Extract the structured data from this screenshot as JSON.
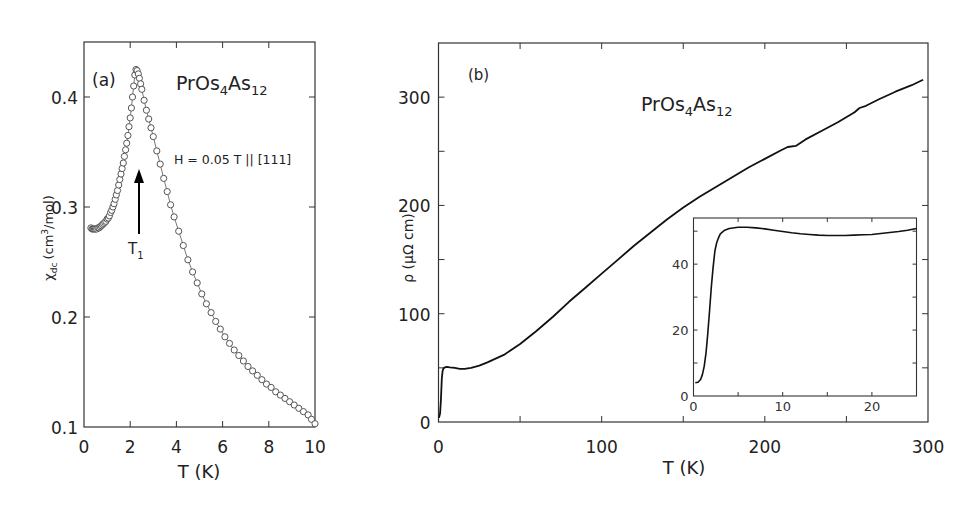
{
  "chart_data": [
    {
      "id": "a",
      "type": "scatter",
      "panel_label": "(a)",
      "title": "PrOs4As12",
      "title_parts": {
        "base1": "PrOs",
        "sub1": "4",
        "base2": "As",
        "sub2": "12"
      },
      "xlabel": "T (K)",
      "ylabel": "χdc (cm3/mol)",
      "ylabel_parts": {
        "chi": "χ",
        "sub": "dc",
        "unit_a": "(cm",
        "sup": "3",
        "unit_b": "/mol)"
      },
      "xlim": [
        0,
        10
      ],
      "ylim": [
        0.1,
        0.45
      ],
      "xticks": [
        0,
        2,
        4,
        6,
        8,
        10
      ],
      "xtick_labels": [
        "0",
        "2",
        "4",
        "6",
        "8",
        "10"
      ],
      "yticks": [
        0.1,
        0.2,
        0.3,
        0.4
      ],
      "ytick_labels": [
        "0.1",
        "0.2",
        "0.3",
        "0.4"
      ],
      "grid": false,
      "marker": "open-circle-connected",
      "annotations": {
        "field": "H = 0.05 T || [111]",
        "arrow_label": "T",
        "arrow_label_sub": "1",
        "arrow_T": 2.25
      },
      "series": [
        {
          "name": "chi_dc",
          "x": [
            0.3,
            0.35,
            0.4,
            0.45,
            0.5,
            0.55,
            0.6,
            0.65,
            0.7,
            0.75,
            0.8,
            0.85,
            0.9,
            0.95,
            1.0,
            1.05,
            1.1,
            1.15,
            1.2,
            1.25,
            1.3,
            1.35,
            1.4,
            1.45,
            1.5,
            1.55,
            1.6,
            1.65,
            1.7,
            1.75,
            1.8,
            1.85,
            1.9,
            1.95,
            2.0,
            2.05,
            2.1,
            2.15,
            2.2,
            2.25,
            2.3,
            2.35,
            2.4,
            2.45,
            2.5,
            2.6,
            2.7,
            2.8,
            2.9,
            3.0,
            3.15,
            3.3,
            3.45,
            3.6,
            3.75,
            3.9,
            4.1,
            4.3,
            4.5,
            4.7,
            4.9,
            5.1,
            5.3,
            5.5,
            5.7,
            5.9,
            6.1,
            6.3,
            6.5,
            6.7,
            6.9,
            7.1,
            7.3,
            7.5,
            7.7,
            7.9,
            8.1,
            8.3,
            8.5,
            8.7,
            8.9,
            9.1,
            9.3,
            9.5,
            9.7,
            9.85,
            10.0
          ],
          "y": [
            0.281,
            0.28,
            0.28,
            0.28,
            0.28,
            0.28,
            0.281,
            0.281,
            0.282,
            0.283,
            0.284,
            0.285,
            0.286,
            0.287,
            0.289,
            0.29,
            0.292,
            0.295,
            0.297,
            0.3,
            0.303,
            0.307,
            0.311,
            0.315,
            0.32,
            0.325,
            0.33,
            0.335,
            0.34,
            0.346,
            0.352,
            0.358,
            0.365,
            0.373,
            0.381,
            0.39,
            0.4,
            0.41,
            0.42,
            0.425,
            0.424,
            0.421,
            0.417,
            0.412,
            0.407,
            0.397,
            0.388,
            0.38,
            0.372,
            0.364,
            0.351,
            0.339,
            0.326,
            0.314,
            0.302,
            0.291,
            0.278,
            0.265,
            0.252,
            0.241,
            0.231,
            0.221,
            0.212,
            0.204,
            0.196,
            0.189,
            0.182,
            0.176,
            0.17,
            0.165,
            0.16,
            0.155,
            0.151,
            0.147,
            0.143,
            0.139,
            0.136,
            0.132,
            0.129,
            0.126,
            0.123,
            0.12,
            0.117,
            0.114,
            0.111,
            0.107,
            0.103
          ]
        }
      ]
    },
    {
      "id": "b",
      "type": "line",
      "panel_label": "(b)",
      "title": "PrOs4As12",
      "title_parts": {
        "base1": "PrOs",
        "sub1": "4",
        "base2": "As",
        "sub2": "12"
      },
      "xlabel": "T (K)",
      "ylabel": "ρ (μΩ cm)",
      "xlim": [
        0,
        300
      ],
      "ylim": [
        0,
        350
      ],
      "xticks": [
        0,
        100,
        200,
        300
      ],
      "xtick_labels": [
        "0",
        "100",
        "200",
        "300"
      ],
      "xminor": [
        50,
        150,
        250
      ],
      "yticks": [
        0,
        100,
        200,
        300
      ],
      "ytick_labels": [
        "0",
        "100",
        "200",
        "300"
      ],
      "yminor": [
        50,
        150,
        250
      ],
      "grid": false,
      "series": [
        {
          "name": "rho",
          "x": [
            0.3,
            1,
            1.5,
            2,
            2.5,
            3,
            4,
            5,
            7,
            10,
            13,
            16,
            20,
            25,
            30,
            40,
            50,
            60,
            70,
            80,
            90,
            100,
            110,
            120,
            130,
            140,
            150,
            160,
            170,
            180,
            190,
            200,
            210,
            214,
            219,
            225,
            235,
            245,
            255,
            258,
            262,
            270,
            280,
            290,
            297
          ],
          "y": [
            4,
            8,
            20,
            40,
            47,
            49.5,
            50.5,
            51,
            50.5,
            50,
            49,
            49,
            50,
            52,
            55,
            62,
            72,
            84,
            97,
            111,
            124,
            137,
            150,
            163,
            175,
            187,
            198,
            208,
            217,
            226,
            235,
            243,
            251,
            254,
            255,
            261,
            269,
            277,
            286,
            290,
            292,
            298,
            305,
            311,
            316
          ]
        }
      ]
    },
    {
      "id": "b-inset",
      "type": "line",
      "xlabel": "",
      "ylabel": "",
      "xlim": [
        0,
        25
      ],
      "ylim": [
        0,
        54
      ],
      "xticks": [
        0,
        10,
        20
      ],
      "xtick_labels": [
        "0",
        "10",
        "20"
      ],
      "xminor": [
        5,
        15
      ],
      "yticks": [
        0,
        20,
        40
      ],
      "ytick_labels": [
        "0",
        "20",
        "40"
      ],
      "yminor": [
        10,
        30,
        50
      ],
      "grid": false,
      "series": [
        {
          "name": "rho_low_T",
          "x": [
            0.2,
            0.5,
            0.8,
            1.0,
            1.2,
            1.4,
            1.6,
            1.8,
            2.0,
            2.2,
            2.4,
            2.6,
            2.8,
            3.0,
            3.5,
            4.0,
            5.0,
            6.0,
            7.0,
            8.0,
            9.0,
            10.0,
            11.0,
            12.0,
            13.0,
            14.0,
            15.0,
            16.0,
            17.0,
            18.0,
            19.0,
            20.0,
            21.0,
            22.0,
            23.0,
            24.0,
            25.0
          ],
          "y": [
            4.0,
            4.2,
            5.0,
            6.5,
            9.0,
            13,
            19,
            26,
            33,
            39,
            44,
            46.5,
            48,
            49.2,
            50.3,
            50.8,
            51.2,
            51.2,
            51.0,
            50.7,
            50.3,
            49.9,
            49.5,
            49.2,
            49.0,
            48.8,
            48.7,
            48.7,
            48.7,
            48.8,
            48.9,
            49.0,
            49.3,
            49.6,
            49.9,
            50.3,
            50.8
          ]
        }
      ]
    }
  ]
}
